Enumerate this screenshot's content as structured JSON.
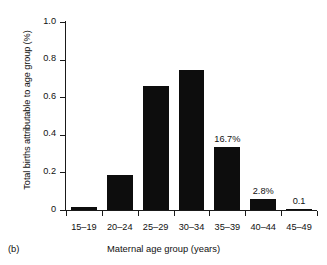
{
  "panel": {
    "label": "(b)"
  },
  "chart_data": {
    "type": "bar",
    "title": "",
    "subtitle": "",
    "xlabel": "Maternal age group (years)",
    "ylabel": "Total births attributable to age group (%)",
    "categories": [
      "15–19",
      "20–24",
      "25–29",
      "30–34",
      "35–39",
      "40–44",
      "45–49"
    ],
    "values": [
      0.017,
      0.185,
      0.66,
      0.745,
      0.333,
      0.058,
      0.003
    ],
    "bar_color": "#0d0d0d",
    "ylim": [
      0,
      1.0
    ],
    "yticks": [
      0,
      0.2,
      0.4,
      0.6,
      0.8,
      1.0
    ],
    "ytick_labels": [
      "0",
      "0.2",
      "0.4",
      "0.6",
      "0.8",
      "1.0"
    ],
    "grid": false,
    "legend": false,
    "annotations": [
      {
        "category": "35–39",
        "text": "16.7%"
      },
      {
        "category": "40–44",
        "text": "2.8%"
      },
      {
        "category": "45–49",
        "text": "0.1"
      }
    ]
  }
}
